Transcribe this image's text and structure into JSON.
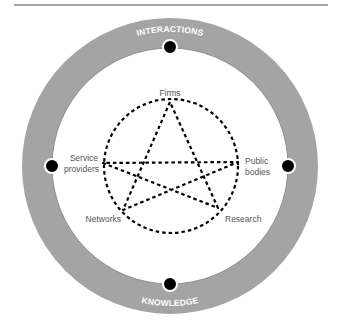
{
  "colors": {
    "rule": "#8a8a8a",
    "ring": "#a4a4a4",
    "ring_inner_edge": "#8e8e8e",
    "dot": "#000000",
    "dot_border": "#ffffff",
    "dashed": "#000000",
    "node_text": "#555555",
    "ring_text": "#ffffff"
  },
  "ring": {
    "labels": {
      "top": "INTERACTIONS",
      "right": "SPECIALIZATION",
      "bottom": "KNOWLEDGE",
      "left": "PROXIMITY"
    }
  },
  "network": {
    "nodes": {
      "top": "Firms",
      "left_line1": "Service",
      "left_line2": "providers",
      "right_line1": "Public",
      "right_line2": "bodies",
      "bottom_left": "Networks",
      "bottom_right": "Research"
    }
  }
}
